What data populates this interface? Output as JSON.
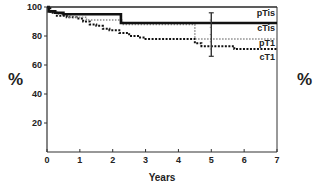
{
  "chart_data": {
    "type": "line",
    "title": "",
    "xlabel": "Years",
    "ylabel": "%",
    "ylabel_right": "%",
    "xlim": [
      0,
      7
    ],
    "ylim": [
      0,
      100
    ],
    "x_ticks": [
      0,
      1,
      2,
      3,
      4,
      5,
      6,
      7
    ],
    "y_ticks": [
      20,
      40,
      60,
      80,
      100
    ],
    "grid": false,
    "legend_position": "inline-right",
    "series": [
      {
        "name": "pTis",
        "style": "solid-thin",
        "color": "#222222",
        "steps": [
          [
            0,
            100
          ],
          [
            7,
            100
          ]
        ]
      },
      {
        "name": "cTis",
        "style": "solid-heavy",
        "color": "#111111",
        "steps": [
          [
            0,
            100
          ],
          [
            0.05,
            97
          ],
          [
            0.25,
            96
          ],
          [
            0.5,
            95
          ],
          [
            2.25,
            95
          ],
          [
            2.25,
            89
          ],
          [
            7,
            89
          ]
        ]
      },
      {
        "name": "pT1",
        "style": "dotted-gray",
        "color": "#888888",
        "steps": [
          [
            0,
            100
          ],
          [
            0.05,
            97
          ],
          [
            0.3,
            95
          ],
          [
            0.7,
            93
          ],
          [
            1.2,
            91
          ],
          [
            2.3,
            91
          ],
          [
            2.3,
            88
          ],
          [
            4.5,
            88
          ],
          [
            4.5,
            78
          ],
          [
            7,
            78
          ]
        ]
      },
      {
        "name": "cT1",
        "style": "dotted-black",
        "color": "#111111",
        "steps": [
          [
            0,
            100
          ],
          [
            0.1,
            96
          ],
          [
            0.3,
            94
          ],
          [
            0.6,
            93
          ],
          [
            0.9,
            92
          ],
          [
            1.1,
            90
          ],
          [
            1.3,
            88
          ],
          [
            1.5,
            87
          ],
          [
            1.7,
            85
          ],
          [
            1.9,
            84
          ],
          [
            2.2,
            82
          ],
          [
            2.5,
            80
          ],
          [
            2.8,
            79
          ],
          [
            3.0,
            78
          ],
          [
            4.4,
            78
          ],
          [
            4.5,
            75
          ],
          [
            4.7,
            73
          ],
          [
            5.6,
            73
          ],
          [
            5.7,
            71
          ],
          [
            7,
            71
          ]
        ]
      }
    ],
    "error_bars": [
      {
        "x": 5,
        "y_low": 66,
        "y_high": 96,
        "series": "cT1"
      }
    ],
    "legend": [
      "pTis",
      "cTis",
      "pT1",
      "cT1"
    ]
  }
}
